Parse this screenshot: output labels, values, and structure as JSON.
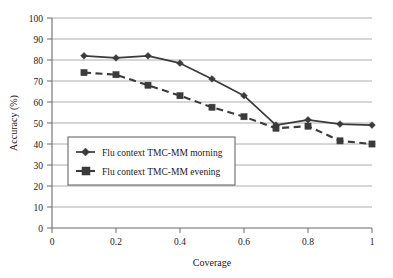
{
  "chart_data": {
    "type": "line",
    "title": "",
    "xlabel": "Coverage",
    "ylabel": "Accuracy (%)",
    "xlim": [
      0,
      1
    ],
    "ylim": [
      0,
      100
    ],
    "xticks": [
      "0",
      "0.2",
      "0.4",
      "0.6",
      "0.8",
      "1"
    ],
    "xtick_values": [
      0,
      0.2,
      0.4,
      0.6,
      0.8,
      1
    ],
    "yticks": [
      "0",
      "10",
      "20",
      "30",
      "40",
      "50",
      "60",
      "70",
      "80",
      "90",
      "100"
    ],
    "ytick_values": [
      0,
      10,
      20,
      30,
      40,
      50,
      60,
      70,
      80,
      90,
      100
    ],
    "grid": "horizontal",
    "legend_position": "lower-left-inside",
    "x": [
      0.1,
      0.2,
      0.3,
      0.4,
      0.5,
      0.6,
      0.7,
      0.8,
      0.9,
      1.0
    ],
    "series": [
      {
        "name": "Flu context TMC-MM morning",
        "marker": "diamond",
        "linestyle": "solid",
        "color": "#3b3b3b",
        "values": [
          82,
          81,
          82,
          78.5,
          71,
          63,
          49,
          51.5,
          49.5,
          49
        ]
      },
      {
        "name": "Flu context TMC-MM evening",
        "marker": "square",
        "linestyle": "dashed",
        "color": "#3b3b3b",
        "values": [
          74,
          73,
          68,
          63,
          57.5,
          53,
          47.5,
          48.5,
          41.5,
          40
        ]
      }
    ]
  },
  "legend": {
    "entries": [
      {
        "label": "Flu context TMC-MM morning"
      },
      {
        "label": "Flu context TMC-MM evening"
      }
    ]
  },
  "axes": {
    "x_title": "Coverage",
    "y_title": "Accuracy (%)"
  }
}
